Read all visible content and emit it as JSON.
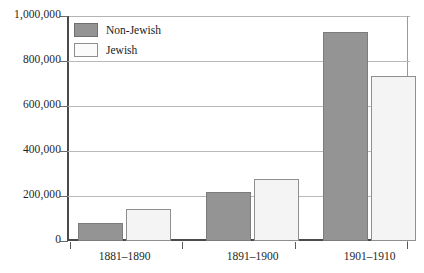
{
  "chart_data": {
    "type": "bar",
    "title": "",
    "xlabel": "",
    "ylabel": "",
    "categories": [
      "1881–1890",
      "1891–1900",
      "1901–1910"
    ],
    "series": [
      {
        "name": "Non-Jewish",
        "color": "#949494",
        "values": [
          79000,
          220000,
          930000
        ]
      },
      {
        "name": "Jewish",
        "color": "#f4f4f4",
        "values": [
          144000,
          275000,
          735000
        ]
      }
    ],
    "ylim": [
      0,
      1000000
    ],
    "yticks": [
      0,
      200000,
      400000,
      600000,
      800000,
      1000000
    ],
    "ytick_labels": [
      "0",
      "200,000",
      "400,000",
      "600,000",
      "800,000",
      "1,000,000"
    ],
    "grid": true,
    "legend_position": "top-left"
  },
  "legend": {
    "items": [
      {
        "label": "Non-Jewish",
        "swatch": "dark-swatch"
      },
      {
        "label": "Jewish",
        "swatch": "light-swatch"
      }
    ]
  },
  "axis": {
    "y_labels": [
      "1,000,000",
      "800,000",
      "600,000",
      "400,000",
      "200,000",
      "0"
    ],
    "x_labels": [
      "1881–1890",
      "1891–1900",
      "1901–1910"
    ]
  }
}
